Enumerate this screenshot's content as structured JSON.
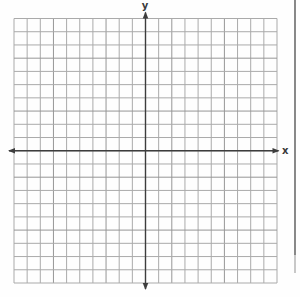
{
  "figure": {
    "kind": "blank-coordinate-plane"
  },
  "axis_labels": {
    "x": "x",
    "y": "y"
  },
  "colors": {
    "paper": "#fefefe",
    "grid_line": "#aaaaaa",
    "grid_line_dark": "#969696",
    "axis": "#3d3d3d",
    "label": "#3a3a3a",
    "scan_edge": "#6b6b6b",
    "scan_edge_fade": "#a3a3a3"
  },
  "geometry": {
    "grid_left": 14,
    "grid_top": 18.5,
    "grid_right": 277,
    "grid_bottom": 283,
    "cols": 20,
    "rows": 20,
    "y_axis_col": 10,
    "x_axis_row": 10,
    "x_axis_start": 9,
    "x_axis_end": 278.5,
    "y_axis_start": 12.5,
    "y_axis_end": 289,
    "arrow_half_width": 2.8,
    "arrow_length": 6,
    "darker_line_indices": [
      3,
      7,
      12,
      16
    ],
    "scan_edge": {
      "x": 295,
      "y_top": 0,
      "y_fade": 255,
      "y_bottom": 273
    }
  },
  "chart_data": {
    "type": "scatter",
    "title": "",
    "xlabel": "x",
    "ylabel": "y",
    "xlim": [
      -10,
      10
    ],
    "ylim": [
      -10,
      10
    ],
    "x_gridlines": 21,
    "y_gridlines": 21,
    "grid": true,
    "legend_position": "none",
    "series": [],
    "annotations": []
  }
}
